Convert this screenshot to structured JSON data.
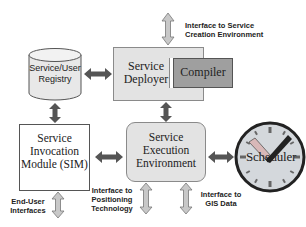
{
  "diagram": {
    "nodes": {
      "registry": {
        "label_line1": "Service/User",
        "label_line2": "Registry",
        "shape": "cylinder"
      },
      "deployer": {
        "label_line1": "Service",
        "label_line2": "Deployer",
        "shape": "rectangle"
      },
      "compiler": {
        "label": "Compiler",
        "shape": "rectangle"
      },
      "sim": {
        "label_line1": "Service",
        "label_line2": "Invocation",
        "label_line3": "Module (SIM)",
        "shape": "rectangle"
      },
      "execution": {
        "label_line1": "Service",
        "label_line2": "Execution",
        "label_line3": "Environment",
        "shape": "rounded-rectangle"
      },
      "scheduler": {
        "label": "Scheduler",
        "shape": "clock"
      }
    },
    "interfaces": {
      "creation": {
        "line1": "Interface to Service",
        "line2": "Creation Environment"
      },
      "end_user": {
        "line1": "End-User",
        "line2": "Interfaces"
      },
      "positioning": {
        "line1": "Interface to",
        "line2": "Positioning",
        "line3": "Technology"
      },
      "gis": {
        "line1": "Interface to",
        "line2": "GIS Data"
      }
    },
    "edges": [
      {
        "from": "registry",
        "to": "deployer",
        "type": "bidirectional"
      },
      {
        "from": "registry",
        "to": "sim",
        "type": "bidirectional"
      },
      {
        "from": "deployer",
        "to": "execution",
        "type": "bidirectional"
      },
      {
        "from": "sim",
        "to": "execution",
        "type": "bidirectional"
      },
      {
        "from": "execution",
        "to": "scheduler",
        "type": "bidirectional"
      },
      {
        "from": "deployer",
        "to": "creation",
        "type": "bidirectional-external"
      },
      {
        "from": "sim",
        "to": "end_user",
        "type": "bidirectional-external"
      },
      {
        "from": "execution",
        "to": "positioning",
        "type": "bidirectional-external"
      },
      {
        "from": "execution",
        "to": "gis",
        "type": "bidirectional-external"
      }
    ],
    "colors": {
      "dark_arrow": "#555555",
      "light_arrow": "#c8c8c8",
      "box_fill": "#e3e3e3",
      "compiler_fill": "#9f9f9f",
      "clock_fill": "#d4d8dc"
    }
  }
}
